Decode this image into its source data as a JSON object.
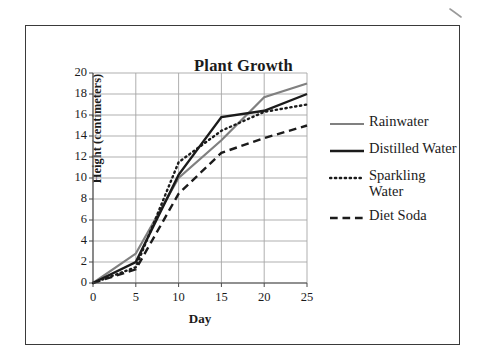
{
  "figure": {
    "title": "Plant Growth",
    "border_color": "#3a3a3a",
    "background": "#ffffff"
  },
  "legend": {
    "position": "right",
    "entries": [
      {
        "label": "Rainwater",
        "style": "solid",
        "color": "#808080",
        "width": 2.2
      },
      {
        "label": "Distilled Water",
        "style": "solid",
        "color": "#1b1b1b",
        "width": 2.4
      },
      {
        "label": "Sparkling Water",
        "style": "dotted",
        "color": "#1b1b1b",
        "width": 2.4
      },
      {
        "label": "Diet Soda",
        "style": "dashed",
        "color": "#1b1b1b",
        "width": 2.4
      }
    ]
  },
  "axes": {
    "x_label": "Day",
    "y_label": "Height (centimeters)",
    "x_ticks": [
      "0",
      "5",
      "10",
      "15",
      "20",
      "25"
    ],
    "y_ticks": [
      "0",
      "2",
      "4",
      "6",
      "8",
      "10",
      "12",
      "14",
      "16",
      "18",
      "20"
    ],
    "grid_color": "#a6a6a6"
  },
  "chart_data": {
    "type": "line",
    "title": "Plant Growth",
    "xlabel": "Day",
    "ylabel": "Height (centimeters)",
    "xlim": [
      0,
      25
    ],
    "ylim": [
      0,
      20
    ],
    "x_tick_step": 5,
    "y_tick_step": 2,
    "grid": true,
    "legend_position": "right",
    "x": [
      0,
      5,
      10,
      15,
      20,
      25
    ],
    "series": [
      {
        "name": "Rainwater",
        "color": "#808080",
        "linestyle": "solid",
        "values": [
          0,
          2.8,
          10.0,
          13.6,
          17.7,
          19.0
        ]
      },
      {
        "name": "Distilled Water",
        "color": "#1b1b1b",
        "linestyle": "solid",
        "values": [
          0,
          2.0,
          10.3,
          15.8,
          16.4,
          18.0
        ]
      },
      {
        "name": "Sparkling Water",
        "color": "#1b1b1b",
        "linestyle": "dotted",
        "values": [
          0,
          1.5,
          11.5,
          14.5,
          16.3,
          17.0
        ]
      },
      {
        "name": "Diet Soda",
        "color": "#1b1b1b",
        "linestyle": "dashed",
        "values": [
          0,
          1.3,
          8.5,
          12.4,
          13.8,
          15.0
        ]
      }
    ]
  }
}
